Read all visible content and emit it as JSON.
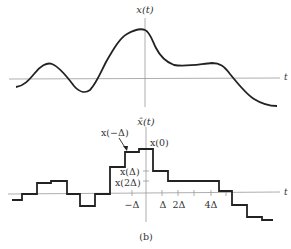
{
  "top_plot": {
    "ylabel": "x(t)",
    "xlabel": "t"
  },
  "bottom_plot": {
    "ylabel": "x̂(t)",
    "xlabel": "t",
    "annotations": {
      "x_minus_delta": "x(−Δ)",
      "x_zero": "x(0)",
      "x_delta": "x(Δ)",
      "x_2delta": "x(2Δ)"
    },
    "ticks": {
      "minus_delta": "−Δ",
      "delta": "Δ",
      "two_delta": "2Δ",
      "four_delta": "4Δ"
    }
  },
  "caption": "(b)"
}
